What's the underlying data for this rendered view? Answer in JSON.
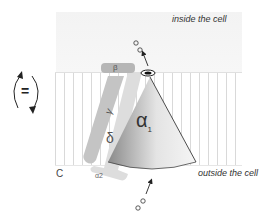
{
  "labels": {
    "inside": "inside the cell",
    "outside": "outside the cell",
    "panel": "C",
    "equilibrium": "="
  },
  "subunits": {
    "alpha1": "α",
    "alpha1_sub": "1",
    "alpha2": "α2",
    "beta": "β",
    "gamma": "γ",
    "delta": "δ"
  },
  "colors": {
    "cone_dark": "#8a8a8a",
    "cone_light": "#f0f0f0",
    "beta": "#b8b8b8",
    "gamma": "#c6c6c6",
    "alpha2_delta": "#dcdcdc",
    "membrane_lines": "#d9d9d9"
  }
}
